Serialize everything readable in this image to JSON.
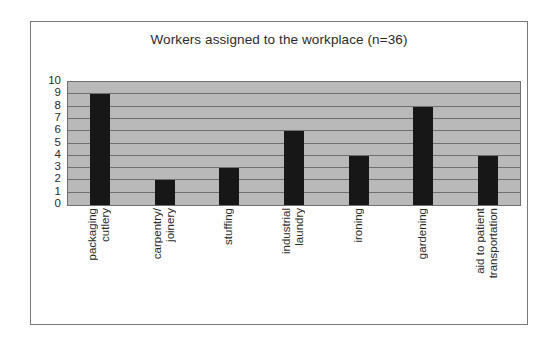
{
  "chart_data": {
    "type": "bar",
    "title": "Workers assigned to the workplace (n=36)",
    "xlabel": "",
    "ylabel": "",
    "ylim": [
      0,
      10
    ],
    "yticks": [
      10,
      9,
      8,
      7,
      6,
      5,
      4,
      3,
      2,
      1,
      0
    ],
    "grid": true,
    "legend": false,
    "categories": [
      "packaging cutlery",
      "carpentry/ joinery",
      "stuffing",
      "industrial laundry",
      "ironing",
      "gardening",
      "aid to patient transportation"
    ],
    "category_lines": [
      [
        "packaging",
        "cutlery"
      ],
      [
        "carpentry/",
        "joinery"
      ],
      [
        "stuffing"
      ],
      [
        "industrial",
        "laundry"
      ],
      [
        "ironing"
      ],
      [
        "gardening"
      ],
      [
        "aid to patient",
        "transportation"
      ]
    ],
    "values": [
      9,
      2,
      3,
      6,
      4,
      8,
      4
    ],
    "colors": {
      "bar": "#171717",
      "plot_background": "#b9b9b9",
      "gridline": "#6f6f6f",
      "frame": "#7a7a7a",
      "text": "#2b2b2b"
    }
  }
}
